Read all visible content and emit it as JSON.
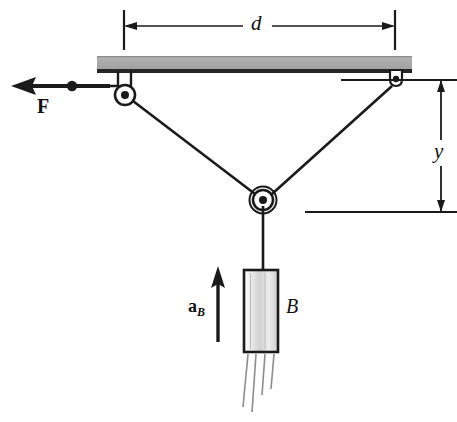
{
  "figure": {
    "background_color": "#ffffff",
    "line_color": "#1a1a1a",
    "beam_color": "#a9a9a9",
    "beam_edge_color": "#1a1a1a",
    "block_fill_light": "#f2f2f2",
    "block_fill_mid": "#d6d6d6"
  },
  "labels": {
    "d": "d",
    "y": "y",
    "B": "B",
    "F": "F",
    "a_base": "a",
    "a_sub": "B"
  },
  "dimensions": {
    "d": {
      "name": "horizontal-span-between-supports",
      "x_left": 124,
      "x_right": 395,
      "y_line": 26,
      "tick_top": 10,
      "tick_bottom": 50
    },
    "y": {
      "name": "vertical-drop-to-lower-pulley",
      "x_line": 441,
      "y_top": 80,
      "y_bottom": 212,
      "upper_extension_x_from": 341,
      "upper_extension_x_to": 457,
      "lower_extension_x_from": 305,
      "lower_extension_x_to": 457
    }
  },
  "geometry": {
    "beam": {
      "x": 97,
      "y": 56,
      "width": 315,
      "height": 16
    },
    "left_pulley": {
      "cx": 125,
      "cy": 95,
      "r_outer": 10,
      "r_inner": 4
    },
    "right_eyelet": {
      "cx": 396,
      "cy": 80,
      "r_outer": 6,
      "r_inner": 3
    },
    "bottom_pulley": {
      "cx": 263,
      "cy": 200,
      "r_outer": 13,
      "r_inner": 4
    },
    "force_arrow": {
      "x_tip": 12,
      "x_tail": 110,
      "y": 86,
      "knot_x": 72,
      "knot_r": 5
    },
    "accel_arrow": {
      "x": 218,
      "y_tail": 342,
      "y_tip": 268
    },
    "block": {
      "x": 244,
      "y": 270,
      "width": 34,
      "height": 82
    },
    "hanger_cable": {
      "x": 263,
      "y_top": 205,
      "y_bottom": 270
    },
    "motion_lines_count": 4
  }
}
